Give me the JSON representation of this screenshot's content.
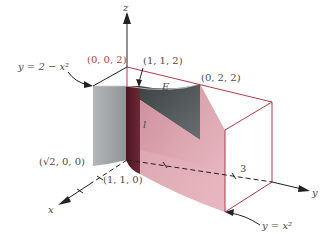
{
  "figure": {
    "type": "3d-solid-region",
    "labels": {
      "z_axis": "z",
      "x_axis": "x",
      "y_axis": "y",
      "top_origin_point": "(0, 0, 2)",
      "point_112": "(1, 1, 2)",
      "point_022": "(0, 2, 2)",
      "point_sqrt200": "(√2, 0, 0)",
      "point_110": "(1, 1, 0)",
      "region": "E",
      "line": "l",
      "y_tick_3": "3",
      "curve_upper": "y = 2 − x²",
      "curve_lower": "y = x²"
    },
    "colors": {
      "pink_surface": "#d99aa6",
      "dark_strip": "#5a1e2a",
      "gray_surface": "#a8abad",
      "dark_gray": "#4e5456",
      "edge_red": "#b23a48",
      "axis": "#222222",
      "highlight_label": "#b23a48"
    }
  }
}
